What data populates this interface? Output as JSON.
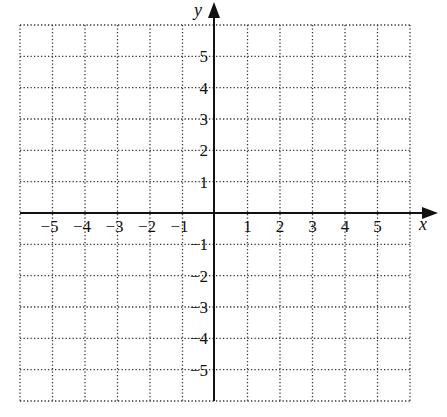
{
  "chart_data": {
    "type": "scatter",
    "title": "",
    "xlabel": "x",
    "ylabel": "y",
    "xlim": [
      -6,
      6
    ],
    "ylim": [
      -6,
      6
    ],
    "grid": true,
    "grid_style": "dotted",
    "grid_step": 1,
    "x_ticks": [
      -5,
      -4,
      -3,
      -2,
      -1,
      1,
      2,
      3,
      4,
      5
    ],
    "x_tick_labels": [
      "−5",
      "−4",
      "−3",
      "−2",
      "−1",
      "1",
      "2",
      "3",
      "4",
      "5"
    ],
    "y_ticks": [
      5,
      4,
      3,
      2,
      1,
      -1,
      -2,
      -3,
      -4,
      -5
    ],
    "y_tick_labels": [
      "5",
      "4",
      "3",
      "2",
      "1",
      "−1",
      "−2",
      "−3",
      "−4",
      "−5"
    ],
    "series": [],
    "legend": null
  },
  "colors": {
    "axis": "#111111",
    "grid": "#333333",
    "background": "#ffffff"
  }
}
